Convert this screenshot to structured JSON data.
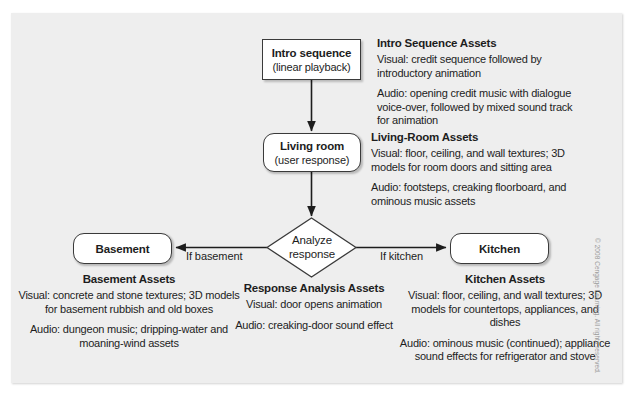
{
  "figure": {
    "panel_bg": "#eeeeee",
    "node_border": "#3a3a3a",
    "text_color": "#1d1d1d"
  },
  "nodes": {
    "intro": {
      "title": "Intro sequence",
      "sub": "(linear playback)"
    },
    "living": {
      "title": "Living room",
      "sub": "(user response)"
    },
    "decision": {
      "line1": "Analyze",
      "line2": "response"
    },
    "basement": {
      "title": "Basement"
    },
    "kitchen": {
      "title": "Kitchen"
    }
  },
  "edge_labels": {
    "if_basement": "If basement",
    "if_kitchen": "If kitchen"
  },
  "assets": {
    "intro": {
      "heading": "Intro Sequence Assets",
      "visual": "Visual: credit sequence followed by introductory animation",
      "audio": "Audio: opening credit music with dialogue voice-over, followed by mixed sound track for animation"
    },
    "living": {
      "heading": "Living-Room Assets",
      "visual": "Visual: floor, ceiling, and wall textures; 3D models for room doors and sitting area",
      "audio": "Audio: footsteps, creaking floorboard, and ominous music assets"
    },
    "basement": {
      "heading": "Basement Assets",
      "visual": "Visual: concrete and stone textures; 3D models for basement rubbish and old boxes",
      "audio": "Audio: dungeon music; dripping-water and moaning-wind assets"
    },
    "response": {
      "heading": "Response Analysis Assets",
      "visual": "Visual: door opens animation",
      "audio": "Audio: creaking-door sound effect"
    },
    "kitchen": {
      "heading": "Kitchen Assets",
      "visual": "Visual: floor, ceiling, and wall textures; 3D models for countertops, appliances, and dishes",
      "audio": "Audio: ominous music (continued); appliance sound effects for refrigerator and stove"
    }
  },
  "copyright": "© 2008 Cengage Learning. All rights reserved."
}
